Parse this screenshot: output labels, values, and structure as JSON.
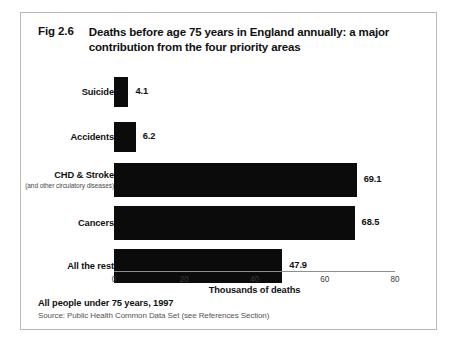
{
  "figure": {
    "number": "Fig 2.6",
    "title": "Deaths before age 75 years in England annually:  a major contribution from the four priority areas",
    "footer_main": "All people under 75 years, 1997",
    "footer_source": "Source: Public Health Common Data Set (see References Section)"
  },
  "chart_data": {
    "type": "bar",
    "orientation": "horizontal",
    "title": "Deaths before age 75 years in England annually:  a major contribution from the four priority areas",
    "xlabel": "Thousands of deaths",
    "ylabel": "",
    "xlim": [
      0,
      80
    ],
    "xticks": [
      0,
      20,
      40,
      60,
      80
    ],
    "xtick_labels": [
      "0",
      "20",
      "40",
      "60",
      "80"
    ],
    "grid": false,
    "legend": false,
    "bar_color": "#0b0b0b",
    "categories": [
      "Suicide",
      "Accidents",
      "CHD & Stroke",
      "Cancers",
      "All the rest"
    ],
    "category_sublabels": [
      "",
      "",
      "(and other circulatory diseases)",
      "",
      ""
    ],
    "values": [
      4.1,
      6.2,
      69.1,
      68.5,
      47.9
    ],
    "value_labels": [
      "4.1",
      "6.2",
      "69.1",
      "68.5",
      "47.9"
    ]
  }
}
